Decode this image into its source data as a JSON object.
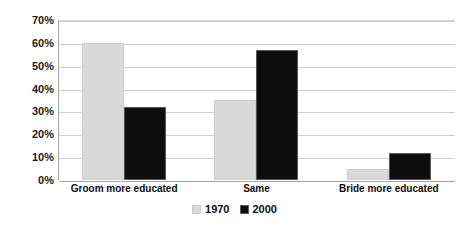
{
  "chart_data": {
    "type": "bar",
    "title": "",
    "subtitle": "",
    "xlabel": "",
    "ylabel": "",
    "categories": [
      "Groom more educated",
      "Same",
      "Bride more educated"
    ],
    "series": [
      {
        "name": "1970",
        "values": [
          60,
          35,
          5
        ],
        "color": "#d9d9d9"
      },
      {
        "name": "2000",
        "values": [
          32,
          57,
          12
        ],
        "color": "#0d0d0d"
      }
    ],
    "ylim": [
      0,
      70
    ],
    "ytick_values": [
      0,
      10,
      20,
      30,
      40,
      50,
      60,
      70
    ],
    "ytick_labels": [
      "0%",
      "10%",
      "20%",
      "30%",
      "40%",
      "50%",
      "60%",
      "70%"
    ],
    "grid": true,
    "legend_position": "bottom"
  },
  "colors": {
    "series_1970": "#d9d9d9",
    "series_2000": "#0d0d0d",
    "gridline": "#d0d0d0",
    "axis": "#a6a6a6",
    "background": "#ffffff",
    "text": "#0d0d0d"
  }
}
